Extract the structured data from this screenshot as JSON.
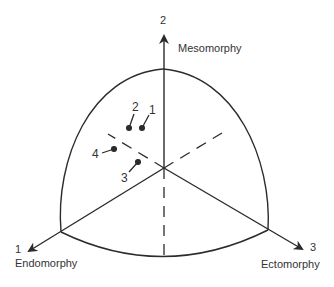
{
  "diagram": {
    "stroke_color": "#2b2b2b",
    "axes": [
      {
        "number": "1",
        "name": "Endomorphy"
      },
      {
        "number": "2",
        "name": "Mesomorphy"
      },
      {
        "number": "3",
        "name": "Ectomorphy"
      }
    ],
    "points": [
      {
        "label": "1"
      },
      {
        "label": "2"
      },
      {
        "label": "3"
      },
      {
        "label": "4"
      }
    ]
  }
}
